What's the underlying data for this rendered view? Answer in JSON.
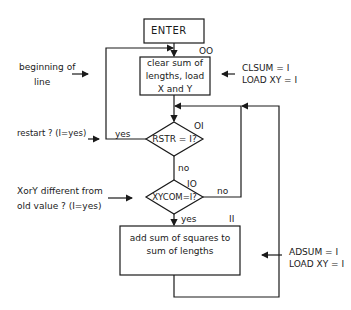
{
  "nodes": {
    "enter": {
      "label": "ENTER"
    },
    "clear": {
      "id": "OO",
      "line1": "clear sum of",
      "line2": "lengths, load",
      "line3": "X and Y"
    },
    "rstr": {
      "id": "OI",
      "label": "RSTR = I?"
    },
    "xycom": {
      "id": "IO",
      "label": "XYCOM=I?"
    },
    "add": {
      "id": "II",
      "line1": "add sum of squares to",
      "line2": "sum of lengths"
    }
  },
  "edges": {
    "rstr_yes": "yes",
    "rstr_no": "no",
    "xycom_no": "no",
    "xycom_yes": "yes"
  },
  "annotations": {
    "beginning": {
      "line1": "beginning of",
      "line2": "line"
    },
    "restart": "restart ? (I=yes)",
    "xory": {
      "line1": "XorY different from",
      "line2": "old value ? (I=yes)"
    },
    "clsum": {
      "line1": "CLSUM = I",
      "line2": "LOAD XY = I"
    },
    "adsum": {
      "line1": "ADSUM = I",
      "line2": "LOAD XY = I"
    }
  },
  "colors": {
    "line": "#1a1a1a",
    "background": "#ffffff"
  }
}
